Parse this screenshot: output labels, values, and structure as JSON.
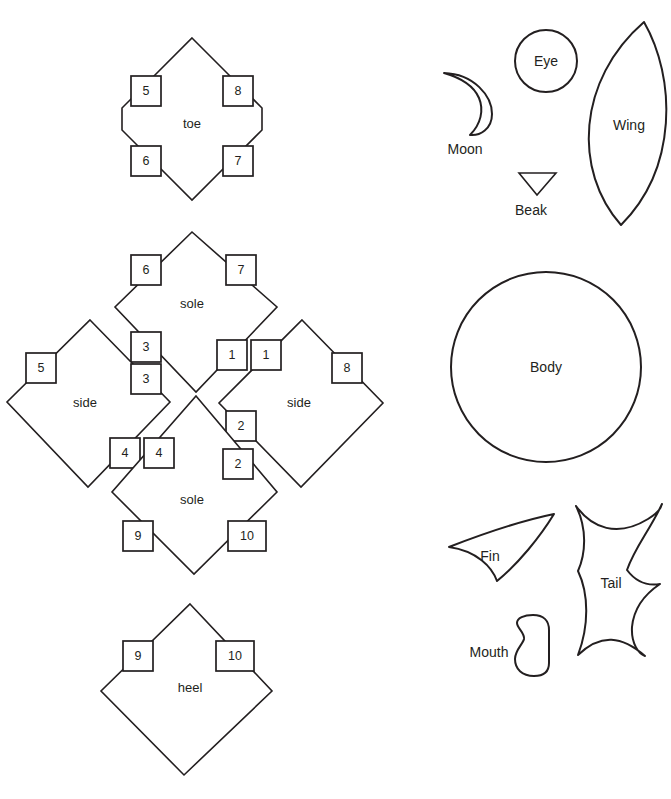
{
  "canvas": {
    "width": 671,
    "height": 799,
    "background": "#ffffff",
    "ink": "#231f20"
  },
  "pattern_diagram": {
    "left_column": {
      "pieces": [
        {
          "name": "toe",
          "label": "toe",
          "label_x": 192,
          "label_y": 125,
          "shape": "octagonal-diamond",
          "tabs": [
            {
              "number": "5",
              "x": 131,
              "y": 76,
              "w": 30,
              "h": 30
            },
            {
              "number": "8",
              "x": 223,
              "y": 76,
              "w": 30,
              "h": 30
            },
            {
              "number": "6",
              "x": 131,
              "y": 146,
              "w": 30,
              "h": 30
            },
            {
              "number": "7",
              "x": 223,
              "y": 146,
              "w": 30,
              "h": 30
            }
          ]
        },
        {
          "name": "sole-top",
          "label": "sole",
          "label_x": 192,
          "label_y": 305,
          "shape": "diamond",
          "tabs": [
            {
              "number": "6",
              "x": 131,
              "y": 255,
              "w": 30,
              "h": 30
            },
            {
              "number": "7",
              "x": 226,
              "y": 255,
              "w": 30,
              "h": 30
            },
            {
              "number": "3",
              "x": 131,
              "y": 332,
              "w": 30,
              "h": 30
            },
            {
              "number": "1",
              "x": 217,
              "y": 340,
              "w": 30,
              "h": 30
            }
          ]
        },
        {
          "name": "side-left",
          "label": "side",
          "label_x": 85,
          "label_y": 404,
          "shape": "diamond",
          "tabs": [
            {
              "number": "5",
              "x": 26,
              "y": 353,
              "w": 30,
              "h": 30
            },
            {
              "number": "3",
              "x": 131,
              "y": 364,
              "w": 30,
              "h": 30
            },
            {
              "number": "4",
              "x": 110,
              "y": 438,
              "w": 30,
              "h": 30
            }
          ]
        },
        {
          "name": "side-right",
          "label": "side",
          "label_x": 299,
          "label_y": 404,
          "shape": "diamond",
          "tabs": [
            {
              "number": "1",
              "x": 251,
              "y": 340,
              "w": 30,
              "h": 30
            },
            {
              "number": "8",
              "x": 332,
              "y": 353,
              "w": 30,
              "h": 30
            },
            {
              "number": "2",
              "x": 226,
              "y": 411,
              "w": 30,
              "h": 30
            }
          ]
        },
        {
          "name": "sole-bottom",
          "label": "sole",
          "label_x": 192,
          "label_y": 501,
          "shape": "diamond",
          "tabs": [
            {
              "number": "4",
              "x": 144,
              "y": 438,
              "w": 30,
              "h": 30
            },
            {
              "number": "2",
              "x": 223,
              "y": 449,
              "w": 30,
              "h": 30
            },
            {
              "number": "9",
              "x": 123,
              "y": 521,
              "w": 30,
              "h": 30
            },
            {
              "number": "10",
              "x": 228,
              "y": 521,
              "w": 38,
              "h": 30
            }
          ]
        },
        {
          "name": "heel",
          "label": "heel",
          "label_x": 190,
          "label_y": 689,
          "shape": "diamond",
          "tabs": [
            {
              "number": "9",
              "x": 123,
              "y": 641,
              "w": 30,
              "h": 30
            },
            {
              "number": "10",
              "x": 216,
              "y": 641,
              "w": 38,
              "h": 30
            }
          ]
        }
      ]
    },
    "right_column": {
      "shapes": [
        {
          "name": "moon",
          "label": "Moon",
          "label_x": 465,
          "label_y": 150,
          "kind": "crescent"
        },
        {
          "name": "eye",
          "label": "Eye",
          "label_x": 546,
          "label_y": 61,
          "kind": "circle"
        },
        {
          "name": "beak",
          "label": "Beak",
          "label_x": 531,
          "label_y": 211,
          "kind": "triangle-down"
        },
        {
          "name": "wing",
          "label": "Wing",
          "label_x": 629,
          "label_y": 126,
          "kind": "lens"
        },
        {
          "name": "body",
          "label": "Body",
          "label_x": 546,
          "label_y": 367,
          "kind": "circle"
        },
        {
          "name": "fin",
          "label": "Fin",
          "label_x": 490,
          "label_y": 557,
          "kind": "curved-triangle"
        },
        {
          "name": "tail",
          "label": "Tail",
          "label_x": 611,
          "label_y": 584,
          "kind": "bowtie"
        },
        {
          "name": "mouth",
          "label": "Mouth",
          "label_x": 489,
          "label_y": 653,
          "kind": "kidney"
        }
      ]
    }
  }
}
